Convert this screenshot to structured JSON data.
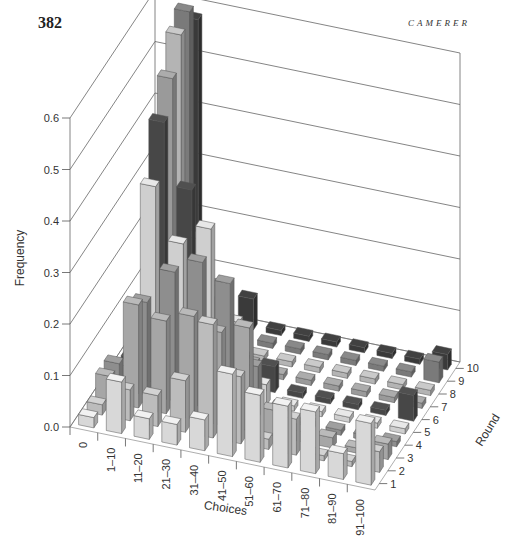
{
  "page": {
    "page_number": "382",
    "running_head": "CAMERER"
  },
  "chart_data": {
    "type": "bar3d",
    "title": "",
    "xlabel": "Choices",
    "ylabel": "Frequency",
    "zlabel": "Round",
    "ylim": [
      0,
      0.6
    ],
    "y_ticks": [
      "0.0",
      "0.1",
      "0.2",
      "0.3",
      "0.4",
      "0.5",
      "0.6"
    ],
    "grid": true,
    "categories": [
      "0",
      "1–10",
      "11–20",
      "21–30",
      "31–40",
      "41–50",
      "51–60",
      "61–70",
      "71–80",
      "81–90",
      "91–100"
    ],
    "rounds": [
      "1",
      "2",
      "3",
      "4",
      "5",
      "6",
      "7",
      "8",
      "9",
      "10"
    ],
    "series": [
      {
        "name": "Round 1",
        "values": [
          0.02,
          0.1,
          0.04,
          0.04,
          0.06,
          0.16,
          0.13,
          0.12,
          0.12,
          0.05,
          0.12
        ]
      },
      {
        "name": "Round 2",
        "values": [
          0.02,
          0.06,
          0.06,
          0.1,
          0.22,
          0.13,
          0.02,
          0.07,
          0.01,
          0.01,
          0.04
        ]
      },
      {
        "name": "Round 3",
        "values": [
          0.05,
          0.2,
          0.18,
          0.2,
          0.18,
          0.2,
          0.05,
          0.02,
          0.02,
          0.01,
          0.03
        ]
      },
      {
        "name": "Round 4",
        "values": [
          0.05,
          0.18,
          0.25,
          0.28,
          0.25,
          0.1,
          0.03,
          0.01,
          0.01,
          0.01,
          0.01
        ]
      },
      {
        "name": "Round 5",
        "values": [
          0.02,
          0.38,
          0.28,
          0.32,
          0.15,
          0.04,
          0.01,
          0.01,
          0.01,
          0.01,
          0.01
        ]
      },
      {
        "name": "Round 6",
        "values": [
          0.01,
          0.48,
          0.36,
          0.15,
          0.05,
          0.05,
          0.01,
          0.01,
          0.01,
          0.01,
          0.05
        ]
      },
      {
        "name": "Round 7",
        "values": [
          0.01,
          0.54,
          0.24,
          0.05,
          0.02,
          0.01,
          0.01,
          0.01,
          0.01,
          0.01,
          0.01
        ]
      },
      {
        "name": "Round 8",
        "values": [
          0.01,
          0.6,
          0.2,
          0.04,
          0.01,
          0.01,
          0.01,
          0.01,
          0.01,
          0.01,
          0.01
        ]
      },
      {
        "name": "Round 9",
        "values": [
          0.01,
          0.62,
          0.1,
          0.02,
          0.01,
          0.01,
          0.01,
          0.01,
          0.01,
          0.01,
          0.04
        ]
      },
      {
        "name": "Round 10",
        "values": [
          0.01,
          0.58,
          0.06,
          0.06,
          0.01,
          0.01,
          0.01,
          0.01,
          0.01,
          0.01,
          0.03
        ]
      }
    ],
    "round_shades": [
      "#d8d8d8",
      "#bcbcbc",
      "#a6a6a6",
      "#8e8e8e",
      "#cfcfcf",
      "#474747",
      "#9a9a9a",
      "#b4b4b4",
      "#7a7a7a",
      "#3a3a3a"
    ]
  }
}
